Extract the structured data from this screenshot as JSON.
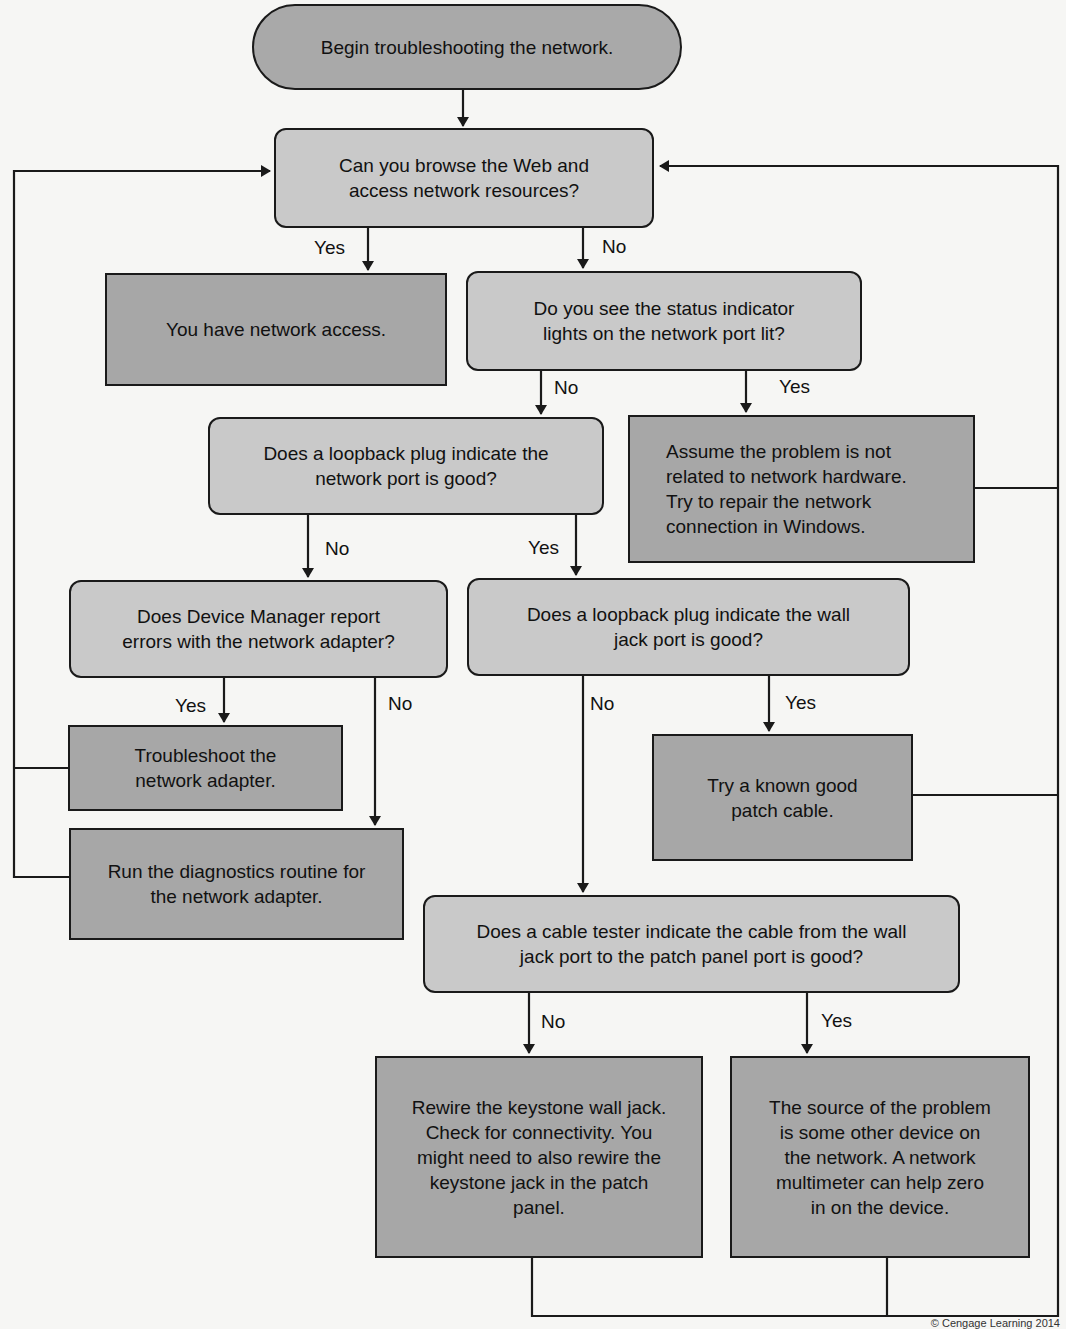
{
  "flowchart": {
    "nodes": {
      "start": {
        "type": "terminal",
        "text": "Begin troubleshooting the network."
      },
      "browse": {
        "type": "decision",
        "text": "Can you browse the Web and\naccess network resources?"
      },
      "have_access": {
        "type": "action",
        "text": "You have network access."
      },
      "status_lights": {
        "type": "decision",
        "text": "Do you see the status indicator\nlights on the network port lit?"
      },
      "loopback_port": {
        "type": "decision",
        "text": "Does a loopback plug indicate the\nnetwork port is good?"
      },
      "not_hardware": {
        "type": "action",
        "text": "Assume the problem is not\nrelated to network hardware.\nTry to repair the network\nconnection in Windows."
      },
      "device_manager": {
        "type": "decision",
        "text": "Does Device Manager report\nerrors with the network adapter?"
      },
      "loopback_wall": {
        "type": "decision",
        "text": "Does a loopback plug indicate the wall\njack port is good?"
      },
      "troubleshoot_adapter": {
        "type": "action",
        "text": "Troubleshoot the\nnetwork adapter."
      },
      "patch_cable": {
        "type": "action",
        "text": "Try a known good\npatch cable."
      },
      "diagnostics": {
        "type": "action",
        "text": "Run the diagnostics routine for\nthe network adapter."
      },
      "cable_tester": {
        "type": "decision",
        "text": "Does a cable tester indicate the cable from the wall\njack port to the patch panel port is good?"
      },
      "rewire": {
        "type": "action",
        "text": "Rewire the keystone wall jack.\nCheck for connectivity. You\nmight need to also rewire the\nkeystone jack in the patch\npanel."
      },
      "other_device": {
        "type": "action",
        "text": "The source of the problem\nis some other device on\nthe network. A network\nmultimeter can help zero\nin on the device."
      }
    },
    "edges": [
      {
        "from": "start",
        "to": "browse",
        "label": ""
      },
      {
        "from": "browse",
        "to": "have_access",
        "label": "Yes"
      },
      {
        "from": "browse",
        "to": "status_lights",
        "label": "No"
      },
      {
        "from": "status_lights",
        "to": "loopback_port",
        "label": "No"
      },
      {
        "from": "status_lights",
        "to": "not_hardware",
        "label": "Yes"
      },
      {
        "from": "loopback_port",
        "to": "device_manager",
        "label": "No"
      },
      {
        "from": "loopback_port",
        "to": "loopback_wall",
        "label": "Yes"
      },
      {
        "from": "device_manager",
        "to": "troubleshoot_adapter",
        "label": "Yes"
      },
      {
        "from": "device_manager",
        "to": "diagnostics",
        "label": "No"
      },
      {
        "from": "loopback_wall",
        "to": "patch_cable",
        "label": "Yes"
      },
      {
        "from": "loopback_wall",
        "to": "cable_tester",
        "label": "No"
      },
      {
        "from": "cable_tester",
        "to": "rewire",
        "label": "No"
      },
      {
        "from": "cable_tester",
        "to": "other_device",
        "label": "Yes"
      },
      {
        "from": "troubleshoot_adapter",
        "to": "browse",
        "label": ""
      },
      {
        "from": "diagnostics",
        "to": "browse",
        "label": ""
      },
      {
        "from": "not_hardware",
        "to": "browse",
        "label": ""
      },
      {
        "from": "patch_cable",
        "to": "browse",
        "label": ""
      },
      {
        "from": "rewire",
        "to": "browse",
        "label": ""
      },
      {
        "from": "other_device",
        "to": "browse",
        "label": ""
      }
    ],
    "labels": {
      "browse_yes": "Yes",
      "browse_no": "No",
      "status_no": "No",
      "status_yes": "Yes",
      "loopback_port_no": "No",
      "loopback_port_yes": "Yes",
      "device_manager_yes": "Yes",
      "device_manager_no": "No",
      "loopback_wall_no": "No",
      "loopback_wall_yes": "Yes",
      "cable_tester_no": "No",
      "cable_tester_yes": "Yes"
    },
    "colors": {
      "terminal_fill": "#a9a9a9",
      "decision_fill": "#c9c9c9",
      "action_fill": "#a7a7a7",
      "line": "#1a1a1a",
      "background": "#f6f6f4"
    }
  },
  "footer": {
    "copyright": "© Cengage Learning 2014"
  }
}
